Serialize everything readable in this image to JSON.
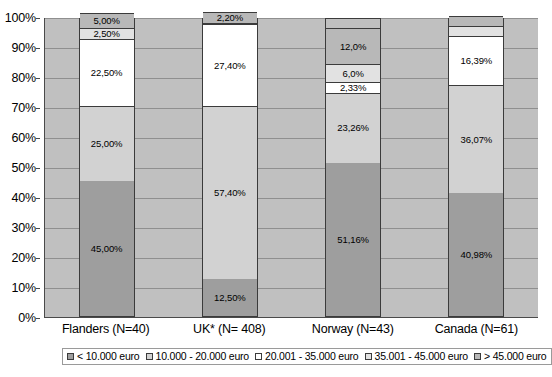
{
  "chart_data": {
    "type": "bar",
    "stacked": true,
    "stack_normalized_percent": true,
    "title": "",
    "xlabel": "",
    "ylabel": "",
    "ylim": [
      0,
      100
    ],
    "grid": true,
    "legend_position": "bottom",
    "categories": [
      "Flanders (N=40)",
      "UK* (N= 408)",
      "Norway (N=43)",
      "Canada (N=61)"
    ],
    "y_ticks": [
      "0%",
      "10%",
      "20%",
      "30%",
      "40%",
      "50%",
      "60%",
      "70%",
      "80%",
      "90%",
      "100%"
    ],
    "y_tick_values": [
      0,
      10,
      20,
      30,
      40,
      50,
      60,
      70,
      80,
      90,
      100
    ],
    "series": [
      {
        "name": "< 10.000 euro",
        "color": "#9e9e9e",
        "values": [
          45.0,
          12.5,
          51.16,
          40.98
        ],
        "labels": [
          "45,00%",
          "12,50%",
          "51,16%",
          "40,98%"
        ]
      },
      {
        "name": "10.000 - 20.000 euro",
        "color": "#d2d2d2",
        "values": [
          25.0,
          57.4,
          23.26,
          36.07
        ],
        "labels": [
          "25,00%",
          "57,40%",
          "23,26%",
          "36,07%"
        ]
      },
      {
        "name": "20.001 - 35.000 euro",
        "color": "#ffffff",
        "values": [
          22.5,
          27.4,
          2.33,
          16.39
        ],
        "labels": [
          "22,50%",
          "27,40%",
          "2,33%",
          "16,39%"
        ]
      },
      {
        "name": "35.001 - 45.000 euro",
        "color": "#e2e2e2",
        "values": [
          2.5,
          0.5,
          6.0,
          3.28
        ],
        "labels": [
          "2,50%",
          "",
          "6,0%",
          ""
        ]
      },
      {
        "name": "> 45.000 euro",
        "color": "#b8b8b8",
        "values": [
          5.0,
          2.2,
          12.0,
          3.28
        ],
        "labels": [
          "5,00%",
          "2,20%",
          "12,0%",
          ""
        ]
      }
    ]
  },
  "legend": {
    "items": [
      {
        "label": "< 10.000 euro",
        "color": "#9e9e9e"
      },
      {
        "label": "10.000 - 20.000 euro",
        "color": "#d2d2d2"
      },
      {
        "label": "20.001 - 35.000 euro",
        "color": "#ffffff"
      },
      {
        "label": "35.001 - 45.000 euro",
        "color": "#e2e2e2"
      },
      {
        "label": "> 45.000 euro",
        "color": "#b8b8b8"
      }
    ]
  }
}
